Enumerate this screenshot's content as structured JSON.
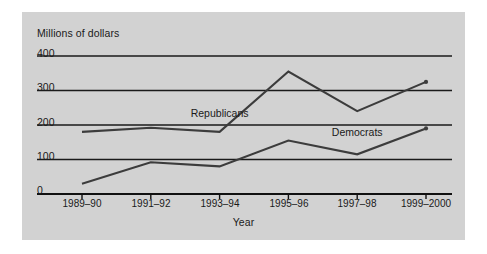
{
  "chart_data": {
    "type": "line",
    "title": "",
    "ylabel": "Millions of dollars",
    "xlabel": "Year",
    "categories": [
      "1989–90",
      "1991–92",
      "1993–94",
      "1995–96",
      "1997–98",
      "1999–2000"
    ],
    "yticks": [
      "0",
      "100",
      "200",
      "300",
      "400"
    ],
    "ylim": [
      0,
      400
    ],
    "grid": true,
    "legend_position": "inline-annotations",
    "series": [
      {
        "name": "Republicans",
        "color": "#3c3c3c",
        "values": [
          180,
          192,
          180,
          355,
          240,
          325
        ],
        "label_x_category": "1993–94",
        "label_value": 232
      },
      {
        "name": "Democrats",
        "color": "#3c3c3c",
        "values": [
          30,
          92,
          80,
          155,
          115,
          190
        ],
        "label_x_category": "1997–98",
        "label_value": 178
      }
    ]
  },
  "axes": {
    "ytick_labels": [
      "400",
      "300",
      "200",
      "100",
      "0"
    ],
    "xtick_labels": [
      "1989–90",
      "1991–92",
      "1993–94",
      "1995–96",
      "1997–98",
      "1999–2000"
    ],
    "ylabel_text": "Millions of dollars",
    "xlabel_text": "Year"
  },
  "annotations": {
    "republicans": "Republicans",
    "democrats": "Democrats"
  },
  "colors": {
    "panel_background": "#d2d2d2",
    "figure_background": "#ffffff",
    "gridline": "#1a1a1a",
    "axis": "#111111",
    "series_line": "#3c3c3c",
    "text": "#1a1a1a"
  }
}
